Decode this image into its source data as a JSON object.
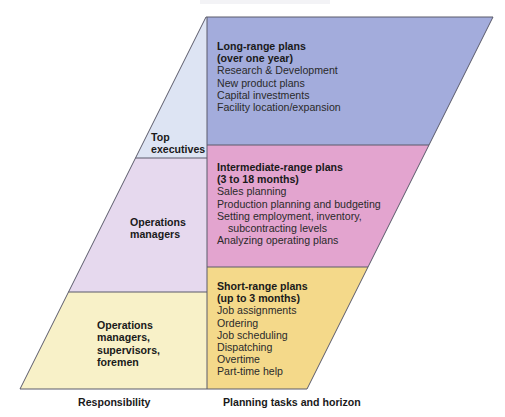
{
  "diagram": {
    "colors": {
      "top_left": "#dde4f3",
      "long_range": "#a3acdc",
      "mid_left": "#e6d9ee",
      "intermediate": "#e3a4cf",
      "bottom_left": "#f8f1c8",
      "short_range": "#f4d98a",
      "stroke": "#5a5a6a"
    },
    "responsibility": {
      "top": [
        "Top",
        "executives"
      ],
      "middle": [
        "Operations",
        "managers"
      ],
      "bottom": [
        "Operations",
        "managers,",
        "supervisors,",
        "foremen"
      ]
    },
    "plans": {
      "long": {
        "title": [
          "Long-range plans",
          "(over one year)"
        ],
        "items": [
          "Research & Development",
          "New product plans",
          "Capital investments",
          "Facility location/expansion"
        ]
      },
      "intermediate": {
        "title": [
          "Intermediate-range plans",
          "(3 to 18 months)"
        ],
        "items": [
          "Sales planning",
          "Production planning and budgeting",
          "Setting employment, inventory,",
          "subcontracting levels",
          "Analyzing operating plans"
        ]
      },
      "short": {
        "title": [
          "Short-range plans",
          "(up to 3 months)"
        ],
        "items": [
          "Job assignments",
          "Ordering",
          "Job scheduling",
          "Dispatching",
          "Overtime",
          "Part-time help"
        ]
      }
    },
    "captions": {
      "left": "Responsibility",
      "right": "Planning tasks and horizon"
    }
  }
}
